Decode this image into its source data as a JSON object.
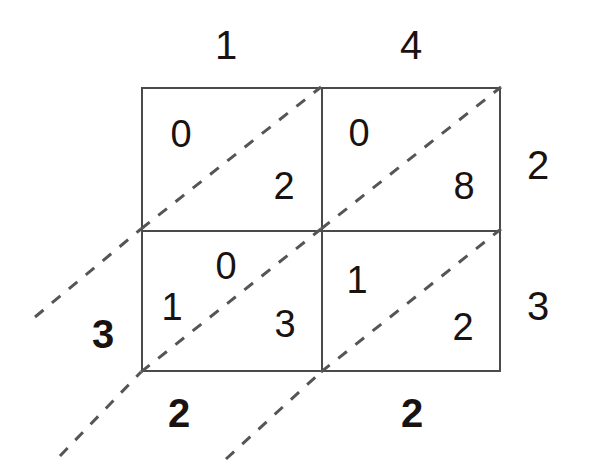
{
  "diagram": {
    "type": "lattice-multiplication",
    "rows": 2,
    "columns": 2
  },
  "top_labels": [
    {
      "value": "1",
      "x": 226,
      "y": 45
    },
    {
      "value": "4",
      "x": 411,
      "y": 45
    }
  ],
  "right_labels": [
    {
      "value": "2",
      "x": 538,
      "y": 165
    },
    {
      "value": "3",
      "x": 538,
      "y": 306
    }
  ],
  "cells": [
    {
      "id": "cell-r0-c0",
      "row": 0,
      "column": 0,
      "upper": "0",
      "lower": "2",
      "upper_x": 181,
      "upper_y": 134,
      "lower_x": 284,
      "lower_y": 186
    },
    {
      "id": "cell-r0-c1",
      "row": 0,
      "column": 1,
      "upper": "0",
      "lower": "8",
      "upper_x": 359,
      "upper_y": 133,
      "lower_x": 464,
      "lower_y": 186
    },
    {
      "id": "cell-r1-c0",
      "row": 1,
      "column": 0,
      "upper": "0",
      "lower": "3",
      "upper_x": 226,
      "upper_y": 266,
      "lower_x": 285,
      "lower_y": 324
    },
    {
      "id": "cell-r1-c1",
      "row": 1,
      "column": 1,
      "upper": "1",
      "lower": "2",
      "upper_x": 357,
      "upper_y": 280,
      "lower_x": 463,
      "lower_y": 327
    }
  ],
  "carry_digits": [
    {
      "id": "carry-1",
      "value": "1",
      "x": 172,
      "y": 307
    }
  ],
  "result_digits": [
    {
      "id": "result-left-3",
      "value": "3",
      "x": 103,
      "y": 334
    },
    {
      "id": "result-bottom-2a",
      "value": "2",
      "x": 179,
      "y": 413
    },
    {
      "id": "result-bottom-2b",
      "value": "2",
      "x": 412,
      "y": 413
    }
  ],
  "diagonals": [
    {
      "id": "diagonal-0",
      "x1": 35,
      "y1": 317,
      "x2": 141,
      "y2": 229
    },
    {
      "id": "diagonal-1",
      "x1": 141,
      "y1": 229,
      "x2": 321,
      "y2": 87
    },
    {
      "id": "diagonal-2",
      "x1": 60,
      "y1": 456,
      "x2": 141,
      "y2": 372
    },
    {
      "id": "diagonal-3",
      "x1": 141,
      "y1": 372,
      "x2": 321,
      "y2": 229
    },
    {
      "id": "diagonal-4",
      "x1": 321,
      "y1": 229,
      "x2": 501,
      "y2": 87
    },
    {
      "id": "diagonal-5",
      "x1": 226,
      "y1": 459,
      "x2": 321,
      "y2": 372
    },
    {
      "id": "diagonal-6",
      "x1": 321,
      "y1": 372,
      "x2": 501,
      "y2": 229
    }
  ],
  "colors": {
    "background": "#ffffff",
    "grid_line": "#4a4a4a",
    "diagonal_line": "#555555",
    "digit": "#1a1210"
  }
}
